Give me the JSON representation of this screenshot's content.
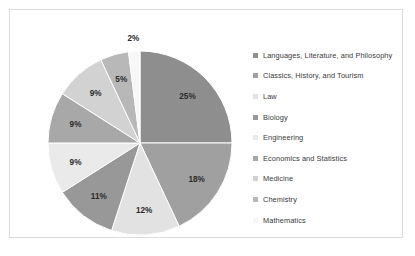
{
  "chart_data": {
    "type": "pie",
    "title": "",
    "subtitle": "",
    "xlabel": "",
    "ylabel": "",
    "legend_position": "right",
    "grid": false,
    "start_angle_deg": 0,
    "direction": "clockwise",
    "categories": [
      "Languages, Literature, and Philosophy",
      "Classics, History, and Tourism",
      "Law",
      "Biology",
      "Engineering",
      "Economics and Statistics",
      "Medicine",
      "Chemistry",
      "Mathematics"
    ],
    "values": [
      25,
      18,
      12,
      11,
      9,
      9,
      9,
      5,
      2
    ],
    "data_labels": [
      "25%",
      "18%",
      "12%",
      "11%",
      "9%",
      "9%",
      "9%",
      "5%",
      "2%"
    ],
    "colors": [
      "#8e8e8e",
      "#a0a0a0",
      "#e2e2e2",
      "#989898",
      "#eaeaea",
      "#a8a8a8",
      "#d2d2d2",
      "#b8b8b8",
      "#f7f7f7"
    ],
    "slices": [
      {
        "label": "Languages, Literature, and Philosophy",
        "value": 25,
        "data_label": "25%",
        "color": "#8e8e8e"
      },
      {
        "label": "Classics, History, and Tourism",
        "value": 18,
        "data_label": "18%",
        "color": "#a0a0a0"
      },
      {
        "label": "Law",
        "value": 12,
        "data_label": "12%",
        "color": "#e2e2e2"
      },
      {
        "label": "Biology",
        "value": 11,
        "data_label": "11%",
        "color": "#989898"
      },
      {
        "label": "Engineering",
        "value": 9,
        "data_label": "9%",
        "color": "#eaeaea"
      },
      {
        "label": "Economics and Statistics",
        "value": 9,
        "data_label": "9%",
        "color": "#a8a8a8"
      },
      {
        "label": "Medicine",
        "value": 9,
        "data_label": "9%",
        "color": "#d2d2d2"
      },
      {
        "label": "Chemistry",
        "value": 5,
        "data_label": "5%",
        "color": "#b8b8b8"
      },
      {
        "label": "Mathematics",
        "value": 2,
        "data_label": "2%",
        "color": "#f7f7f7"
      }
    ]
  },
  "frame": {
    "border_color": "#dcdcdc",
    "background": "#ffffff"
  }
}
